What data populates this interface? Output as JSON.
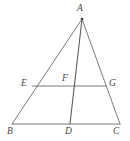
{
  "figure": {
    "type": "geometry-diagram",
    "canvas": {
      "width": 130,
      "height": 141
    },
    "stroke_color": "#6d6a67",
    "label_color": "#4a4744",
    "background_color": "#ffffff",
    "points": [
      {
        "id": "A",
        "label": "A",
        "x": 82,
        "y": 19,
        "label_x": 77,
        "label_y": 4,
        "marked": true
      },
      {
        "id": "B",
        "label": "B",
        "x": 12,
        "y": 124,
        "label_x": 7,
        "label_y": 127,
        "marked": false
      },
      {
        "id": "C",
        "label": "C",
        "x": 120,
        "y": 124,
        "label_x": 113,
        "label_y": 127,
        "marked": false
      },
      {
        "id": "D",
        "label": "D",
        "x": 70,
        "y": 124,
        "label_x": 65,
        "label_y": 127,
        "marked": false
      },
      {
        "id": "E",
        "label": "E",
        "x": 32,
        "y": 86,
        "label_x": 21,
        "label_y": 79,
        "marked": false
      },
      {
        "id": "F",
        "label": "F",
        "x": 70,
        "y": 86,
        "label_x": 62,
        "label_y": 74,
        "marked": false
      },
      {
        "id": "G",
        "label": "G",
        "x": 106,
        "y": 86,
        "label_x": 109,
        "label_y": 79,
        "marked": false
      }
    ],
    "segments": [
      {
        "id": "AB",
        "from": "A",
        "to": "B",
        "role": "triangle-side"
      },
      {
        "id": "AC",
        "from": "A",
        "to": "C",
        "role": "triangle-side"
      },
      {
        "id": "BC",
        "from": "B",
        "to": "C",
        "role": "triangle-base"
      },
      {
        "id": "AD",
        "from": "A",
        "to": "D",
        "role": "cevian"
      },
      {
        "id": "EG",
        "from": "E",
        "to": "G",
        "role": "midsegment"
      }
    ]
  }
}
